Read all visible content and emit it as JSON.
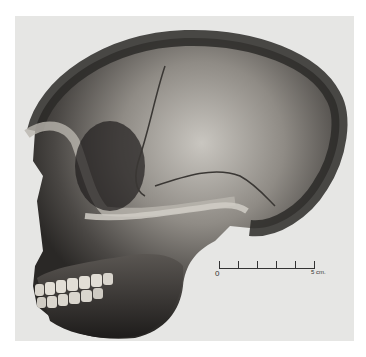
{
  "figure": {
    "background_color": "#e6e6e4",
    "scale_bar": {
      "start_label": "0",
      "end_label": "5 cm.",
      "tick_count": 6
    }
  }
}
